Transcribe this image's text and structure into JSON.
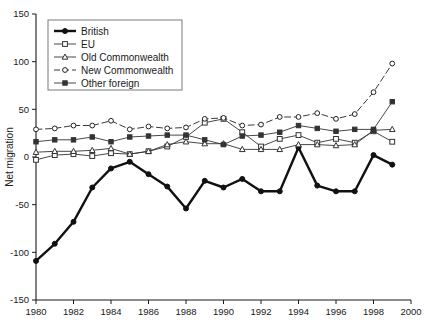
{
  "chart_data": {
    "type": "line",
    "title": "",
    "subtitle": "",
    "xlabel": "",
    "ylabel": "Net migration",
    "xlim": [
      1980,
      2000
    ],
    "ylim": [
      -150,
      150
    ],
    "ytick_step": 50,
    "xtick_step": 2,
    "grid": false,
    "legend_position": "top-left",
    "x": [
      1980,
      1981,
      1982,
      1983,
      1984,
      1985,
      1986,
      1987,
      1988,
      1989,
      1990,
      1991,
      1992,
      1993,
      1994,
      1995,
      1996,
      1997,
      1998,
      1999
    ],
    "xticklabels": [
      "1980",
      "1982",
      "1984",
      "1986",
      "1988",
      "1990",
      "1992",
      "1994",
      "1996",
      "1998",
      "2000"
    ],
    "yticklabels": [
      "150",
      "100",
      "50",
      "0",
      "-50",
      "-100",
      "-150"
    ],
    "series": [
      {
        "name": "British",
        "marker": "filled-circle",
        "linestyle": "solid-thick",
        "color": "#111111",
        "values": [
          -109,
          -91,
          -68,
          -32,
          -12,
          -5,
          -18,
          -31,
          -54,
          -25,
          -32,
          -23,
          -36,
          -36,
          10,
          -30,
          -36,
          -36,
          2,
          -8
        ]
      },
      {
        "name": "EU",
        "marker": "open-square",
        "linestyle": "solid-thin",
        "color": "#333333",
        "values": [
          -3,
          2,
          3,
          1,
          4,
          3,
          6,
          11,
          21,
          36,
          40,
          26,
          11,
          19,
          23,
          15,
          19,
          15,
          27,
          16
        ]
      },
      {
        "name": "Old Commonwealth",
        "marker": "open-triangle",
        "linestyle": "solid-thin",
        "color": "#333333",
        "values": [
          5,
          6,
          6,
          7,
          9,
          3,
          6,
          13,
          16,
          14,
          14,
          8,
          8,
          8,
          13,
          13,
          12,
          13,
          28,
          29
        ]
      },
      {
        "name": "New Commonwealth",
        "marker": "open-circle",
        "linestyle": "dashed",
        "color": "#222222",
        "values": [
          29,
          30,
          33,
          33,
          38,
          29,
          32,
          30,
          31,
          40,
          41,
          33,
          34,
          42,
          42,
          46,
          40,
          45,
          68,
          98
        ]
      },
      {
        "name": "Other foreign",
        "marker": "filled-square",
        "linestyle": "solid-thin",
        "color": "#333333",
        "values": [
          16,
          18,
          18,
          21,
          16,
          21,
          22,
          23,
          23,
          18,
          13,
          22,
          23,
          26,
          33,
          30,
          27,
          29,
          29,
          58
        ]
      }
    ]
  },
  "legend": {
    "items": [
      {
        "label": "British"
      },
      {
        "label": "EU"
      },
      {
        "label": "Old Commonwealth"
      },
      {
        "label": "New Commonwealth"
      },
      {
        "label": "Other foreign"
      }
    ]
  }
}
